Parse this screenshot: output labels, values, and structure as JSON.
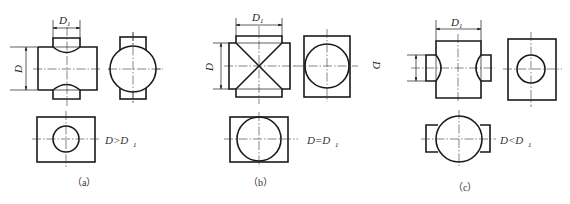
{
  "figure": {
    "panels": [
      {
        "id": "a",
        "caption": "（a）",
        "condition": "D>D",
        "condition_sub": "1",
        "dim_top_label": "D",
        "dim_top_sub": "1",
        "dim_left_label": "D"
      },
      {
        "id": "b",
        "caption": "（b）",
        "condition": "D=D",
        "condition_sub": "1",
        "dim_top_label": "D",
        "dim_top_sub": "1",
        "dim_left_label": "D",
        "dim_right_label": "D"
      },
      {
        "id": "c",
        "caption": "（c）",
        "condition": "D<D",
        "condition_sub": "1",
        "dim_top_label": "D",
        "dim_top_sub": "1"
      }
    ]
  },
  "colors": {
    "line": "#1a1a1a",
    "background": "#ffffff"
  }
}
